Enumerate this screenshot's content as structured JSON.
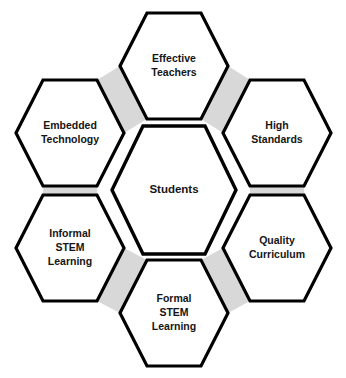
{
  "diagram": {
    "type": "hexagonal-honeycomb",
    "canvas": {
      "width": 346,
      "height": 378
    },
    "colors": {
      "background": "#ffffff",
      "hexagon_fill": "#ffffff",
      "hexagon_stroke": "#000000",
      "connector_gray": "#d8d8d8",
      "text": "#151515"
    },
    "center": {
      "id": "students",
      "label": "Students",
      "lines": [
        "Students"
      ],
      "cx": 174,
      "cy": 190,
      "rx": 62,
      "ry": 64,
      "font_size": 11.5
    },
    "nodes": [
      {
        "id": "effective-teachers",
        "label": "Effective Teachers",
        "lines": [
          "Effective",
          "Teachers"
        ],
        "position": "top",
        "cx": 174,
        "cy": 66,
        "rx": 54,
        "ry": 53,
        "font_size": 10.5
      },
      {
        "id": "high-standards",
        "label": "High Standards",
        "lines": [
          "High",
          "Standards"
        ],
        "position": "top-right",
        "cx": 277,
        "cy": 133,
        "rx": 54,
        "ry": 53,
        "font_size": 10.5
      },
      {
        "id": "quality-curriculum",
        "label": "Quality Curriculum",
        "lines": [
          "Quality",
          "Curriculum"
        ],
        "position": "bottom-right",
        "cx": 277,
        "cy": 248,
        "rx": 54,
        "ry": 53,
        "font_size": 10.5
      },
      {
        "id": "formal-stem-learning",
        "label": "Formal STEM Learning",
        "lines": [
          "Formal",
          "STEM",
          "Learning"
        ],
        "position": "bottom",
        "cx": 174,
        "cy": 313,
        "rx": 54,
        "ry": 53,
        "font_size": 10.5
      },
      {
        "id": "informal-stem-learning",
        "label": "Informal STEM Learning",
        "lines": [
          "Informal",
          "STEM",
          "Learning"
        ],
        "position": "bottom-left",
        "cx": 70,
        "cy": 248,
        "rx": 54,
        "ry": 53,
        "font_size": 10.5
      },
      {
        "id": "embedded-technology",
        "label": "Embedded Technology",
        "lines": [
          "Embedded",
          "Technology"
        ],
        "position": "top-left",
        "cx": 70,
        "cy": 133,
        "rx": 54,
        "ry": 53,
        "font_size": 10.5
      }
    ],
    "connectors": [
      {
        "id": "connector-teachers-standards",
        "from": "effective-teachers",
        "to": "high-standards"
      },
      {
        "id": "connector-standards-curriculum",
        "from": "high-standards",
        "to": "quality-curriculum"
      },
      {
        "id": "connector-curriculum-formal",
        "from": "quality-curriculum",
        "to": "formal-stem-learning"
      },
      {
        "id": "connector-formal-informal",
        "from": "formal-stem-learning",
        "to": "informal-stem-learning"
      },
      {
        "id": "connector-informal-embedded",
        "from": "informal-stem-learning",
        "to": "embedded-technology"
      },
      {
        "id": "connector-embedded-teachers",
        "from": "embedded-technology",
        "to": "effective-teachers"
      }
    ]
  }
}
